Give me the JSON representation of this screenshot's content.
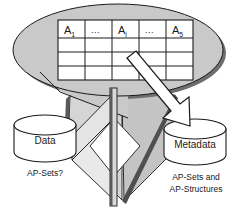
{
  "diagram": {
    "colors": {
      "ellipse_fill": "#c9c9c9",
      "ellipse_shadow": "#6e6e6e",
      "chevron_fill": "#c9c9c9",
      "chevron_light": "#e2e2e2",
      "chevron_edge": "#5a5a5a",
      "cylinder_fill": "#ffffff",
      "outline": "#1a1a1a",
      "arrow_fill": "#ffffff",
      "text": "#1a1a1a"
    },
    "callout": {
      "name": "table-callout-ellipse",
      "table": {
        "columns": 5,
        "rows": 4,
        "headers": [
          {
            "label": "A",
            "subscript": "1"
          },
          {
            "label": "...",
            "subscript": ""
          },
          {
            "label": "A",
            "subscript": "i"
          },
          {
            "label": "...",
            "subscript": ""
          },
          {
            "label": "A",
            "subscript": "5"
          }
        ],
        "body_rows": [
          [
            "",
            "",
            "",
            "",
            ""
          ],
          [
            "",
            "",
            "",
            "",
            ""
          ],
          [
            "",
            "",
            "",
            "",
            ""
          ]
        ]
      }
    },
    "stores": [
      {
        "id": "data",
        "name": "data-cylinder",
        "label": "Data",
        "caption": [
          "AP-Sets?"
        ]
      },
      {
        "id": "metadata",
        "name": "metadata-cylinder",
        "label": "Metadata",
        "caption": [
          "AP-Sets and",
          "AP-Structures"
        ]
      }
    ],
    "arrows": [
      {
        "id": "table-to-metadata",
        "name": "table-to-metadata-arrow",
        "from": "table-callout",
        "to": "metadata-cylinder",
        "style": "outlined-block-arrow"
      }
    ],
    "chevron": {
      "name": "folded-chevron-shape",
      "direction": "down",
      "style": "3d-folded-panels"
    }
  }
}
